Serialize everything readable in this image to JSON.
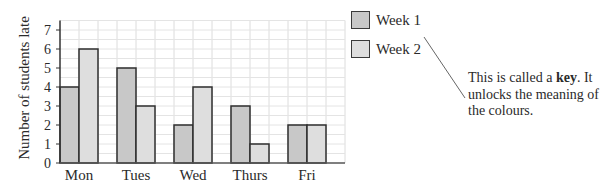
{
  "chart_data": {
    "type": "bar",
    "title": "",
    "xlabel": "",
    "ylabel": "Number of students late",
    "categories": [
      "Mon",
      "Tues",
      "Wed",
      "Thurs",
      "Fri"
    ],
    "series": [
      {
        "name": "Week 1",
        "values": [
          4,
          5,
          2,
          3,
          2
        ],
        "color": "#c8c8c8"
      },
      {
        "name": "Week 2",
        "values": [
          6,
          3,
          4,
          1,
          2
        ],
        "color": "#dedede"
      }
    ],
    "ylim": [
      0,
      7.5
    ],
    "yticks": [
      0,
      1,
      2,
      3,
      4,
      5,
      6,
      7
    ],
    "grid": true,
    "legend_position": "right"
  },
  "legend": {
    "items": [
      {
        "label": "Week 1"
      },
      {
        "label": "Week 2"
      }
    ]
  },
  "annotation": {
    "text_before": "This is called a ",
    "bold": "key",
    "text_after": ". It unlocks the meaning of the colours."
  }
}
